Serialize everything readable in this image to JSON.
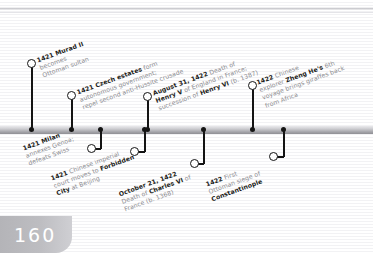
{
  "page": {
    "number": "160",
    "orientation": "landscape",
    "type": "timeline-spread"
  },
  "timeline": {
    "axis_label": "timeline-axis",
    "events_above": [
      {
        "id": "murad-ii",
        "date": "1421",
        "headline": "Murad II",
        "lines": [
          {
            "bold": "1421 Murad II",
            "rest": ""
          },
          {
            "bold": "",
            "rest": "becomes"
          },
          {
            "bold": "",
            "rest": "Ottoman sultan"
          }
        ],
        "dot_x": 31,
        "circle_x": 37,
        "circle_y": 63,
        "label_x": 46,
        "label_y": 60
      },
      {
        "id": "czech-estates",
        "date": "1421",
        "headline": "Czech estates",
        "lines": [
          {
            "bold": "1421 Czech estates",
            "rest": " form"
          },
          {
            "bold": "",
            "rest": "autonomous government;"
          },
          {
            "bold": "",
            "rest": "repel second anti-Hussite crusade"
          }
        ],
        "dot_x": 71,
        "circle_x": 77,
        "circle_y": 95,
        "label_x": 86,
        "label_y": 92
      },
      {
        "id": "death-of-henry-v",
        "date": "August 31, 1422",
        "headline": "Death of Henry V",
        "lines": [
          {
            "bold": "August 31, 1422",
            "rest": " Death of"
          },
          {
            "bold": "Henry V",
            "rest": " of England in France;"
          },
          {
            "bold": "",
            "rest": "succession of "
          },
          {
            "bold2": "Henry VI",
            "rest2": " (b. 1387)"
          }
        ],
        "dot_x": 147,
        "circle_x": 153,
        "circle_y": 96,
        "label_x": 162,
        "label_y": 93
      },
      {
        "id": "zheng-he-sixth-voyage",
        "date": "1422",
        "headline": "Zheng He's 6th voyage",
        "lines": [
          {
            "bold": "1422",
            "rest": " Chinese"
          },
          {
            "bold": "",
            "rest": "explorer "
          },
          {
            "bold2": "Zheng He's",
            "rest2": " 6th"
          },
          {
            "bold": "",
            "rest": "voyage brings giraffes back"
          },
          {
            "bold": "",
            "rest": "from Africa"
          }
        ],
        "dot_x": 252,
        "circle_x": 258,
        "circle_y": 85,
        "label_x": 267,
        "label_y": 82
      }
    ],
    "events_below": [
      {
        "id": "milan-annexes-genoa",
        "date": "1421",
        "headline": "Milan",
        "lines": [
          {
            "bold": "1421 Milan",
            "rest": ""
          },
          {
            "bold": "",
            "rest": "annexes Genoa;"
          },
          {
            "bold": "",
            "rest": "defeats Swiss"
          }
        ],
        "dot_x": 100,
        "circle_x": 91,
        "circle_y": 152,
        "label_x": 30,
        "label_y": 150
      },
      {
        "id": "forbidden-city-move",
        "date": "1421",
        "headline": "Forbidden City",
        "lines": [
          {
            "bold": "1421",
            "rest": " Chinese imperial"
          },
          {
            "bold": "",
            "rest": "court moves to "
          },
          {
            "bold2": "Forbidden",
            "rest2": ""
          },
          {
            "bold3": "City",
            "rest3": " at Beijing"
          }
        ],
        "dot_x": 144,
        "circle_x": 134,
        "circle_y": 155,
        "label_x": 58,
        "label_y": 180
      },
      {
        "id": "death-of-charles-vi",
        "date": "October 21, 1422",
        "headline": "Death of Charles VI",
        "lines": [
          {
            "bold": "October 21, 1422",
            "rest": ""
          },
          {
            "bold": "",
            "rest": "Death of "
          },
          {
            "bold2": "Charles VI",
            "rest2": " of"
          },
          {
            "bold": "",
            "rest": "France (b. 1368)"
          }
        ],
        "dot_x": 203,
        "circle_x": 194,
        "circle_y": 167,
        "label_x": 126,
        "label_y": 196
      },
      {
        "id": "first-ottoman-siege",
        "date": "1422",
        "headline": "Constantinople siege",
        "lines": [
          {
            "bold": "1422",
            "rest": " First"
          },
          {
            "bold": "",
            "rest": "Ottoman siege of"
          },
          {
            "bold2": "Constantinople",
            "rest2": ""
          }
        ],
        "dot_x": 283,
        "circle_x": 273,
        "circle_y": 160,
        "label_x": 213,
        "label_y": 186
      }
    ]
  },
  "colors": {
    "ink": "#1d1d20",
    "muted_text": "#8b8b90",
    "axis_dark": "#8e8e93",
    "axis_light": "#e9e9ec",
    "page_tab": "#bdbdc1",
    "rule": "#f2f2f4"
  }
}
